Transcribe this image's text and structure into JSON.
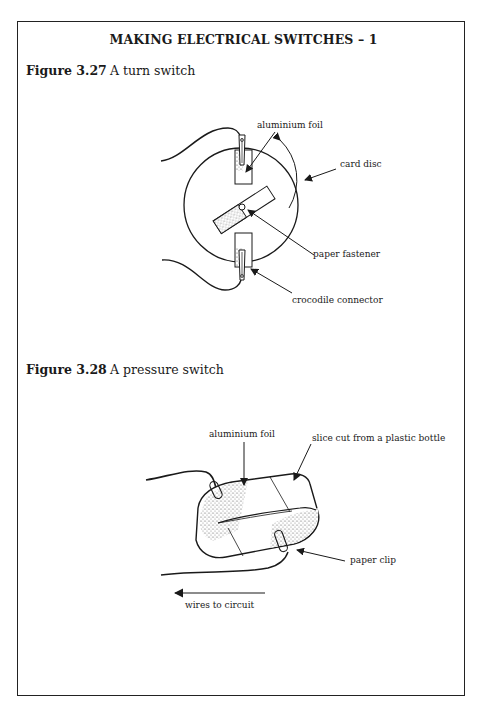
{
  "page": {
    "title": "MAKING ELECTRICAL SWITCHES – 1"
  },
  "figures": [
    {
      "number": "Figure 3.27",
      "caption": "A turn switch",
      "labels": {
        "aluminium_foil": "aluminium foil",
        "card_disc": "card disc",
        "paper_fastener": "paper fastener",
        "crocodile_connector": "crocodile connector"
      }
    },
    {
      "number": "Figure 3.28",
      "caption": "A pressure switch",
      "labels": {
        "aluminium_foil": "aluminium foil",
        "bottle_slice": "slice cut from a plastic bottle",
        "paper_clip": "paper clip",
        "wires_to_circuit": "wires to circuit"
      }
    }
  ]
}
